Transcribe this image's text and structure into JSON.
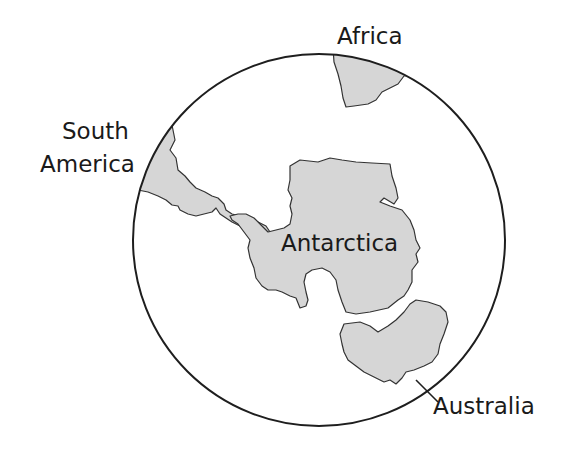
{
  "map": {
    "title": "",
    "labels": {
      "africa": "Africa",
      "south_america_line1": "South",
      "south_america_line2": "America",
      "antarctica": "Antarctica",
      "australia": "Australia"
    },
    "colors": {
      "land": "#d6d6d6",
      "outline": "#333333",
      "globe_border": "#1e1e1e",
      "background": "#ffffff"
    },
    "landmasses": [
      "Africa",
      "South America",
      "Antarctica",
      "Australia"
    ]
  }
}
